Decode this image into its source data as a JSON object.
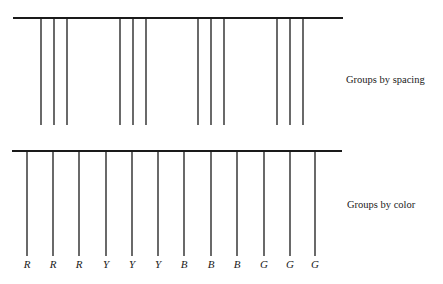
{
  "figure": {
    "background": "#ffffff",
    "ink": "#1a1a1a"
  },
  "spacing_panel": {
    "caption": "Groups by spacing",
    "bar": {
      "x1": 13,
      "x2": 343,
      "y": 18
    },
    "line_top": 18,
    "line_bottom": 125,
    "groups": [
      {
        "lines_x": [
          41,
          54,
          67
        ]
      },
      {
        "lines_x": [
          120,
          133,
          146
        ]
      },
      {
        "lines_x": [
          198,
          211,
          224
        ]
      },
      {
        "lines_x": [
          277,
          290,
          303
        ]
      }
    ]
  },
  "color_panel": {
    "caption": "Groups by color",
    "bar": {
      "x1": 12,
      "x2": 342,
      "y": 151
    },
    "line_top": 151,
    "line_bottom": 256,
    "label_y": 268,
    "lines": [
      {
        "x": 27,
        "label": "R"
      },
      {
        "x": 53,
        "label": "R"
      },
      {
        "x": 79,
        "label": "R"
      },
      {
        "x": 106,
        "label": "Y"
      },
      {
        "x": 132,
        "label": "Y"
      },
      {
        "x": 158,
        "label": "Y"
      },
      {
        "x": 184,
        "label": "B"
      },
      {
        "x": 211,
        "label": "B"
      },
      {
        "x": 237,
        "label": "B"
      },
      {
        "x": 264,
        "label": "G"
      },
      {
        "x": 290,
        "label": "G"
      },
      {
        "x": 315,
        "label": "G"
      }
    ]
  }
}
